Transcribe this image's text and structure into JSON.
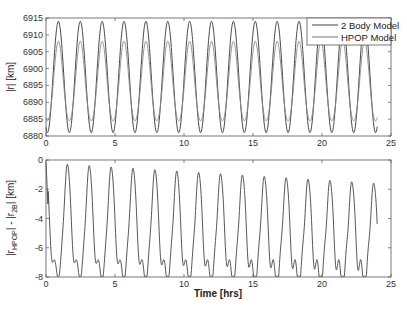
{
  "chart_data": [
    {
      "type": "line",
      "title": "",
      "xlabel": "",
      "ylabel": "|r| [km]",
      "xlim": [
        0,
        25
      ],
      "ylim": [
        6880,
        6915
      ],
      "xticks": [
        0,
        5,
        10,
        15,
        20,
        25
      ],
      "yticks": [
        6880,
        6885,
        6890,
        6895,
        6900,
        6905,
        6910,
        6915
      ],
      "grid": false,
      "legend_position": "upper right",
      "series": [
        {
          "name": "2 Body Model",
          "model": {
            "mean": 6897.5,
            "amp": 16.5,
            "period": 1.585,
            "phase_peak": 0.9,
            "harm2": 0,
            "t_end": 24
          }
        },
        {
          "name": "HPOP Model",
          "model": {
            "mean": 6895.5,
            "amp": 11.8,
            "period": 1.585,
            "phase_peak": 0.9,
            "harm2": 0.8,
            "t_end": 24
          }
        }
      ],
      "summary": {
        "2 Body Model": {
          "max": 6914,
          "min": 6881
        },
        "HPOP Model": {
          "max": 6907,
          "min": 6883.5
        }
      }
    },
    {
      "type": "line",
      "title": "",
      "xlabel": "Time [hrs]",
      "ylabel": "|r_HPOP| - |r_2B| [km]",
      "xlim": [
        0,
        25
      ],
      "ylim": [
        -8,
        0
      ],
      "xticks": [
        0,
        5,
        10,
        15,
        20,
        25
      ],
      "yticks": [
        -8,
        -6,
        -4,
        -2,
        0
      ],
      "grid": false,
      "series": [
        {
          "name": "difference",
          "peaks_start": -0.2,
          "peaks_end": -1.6,
          "troughs_start": -7.5,
          "troughs_end": -8.0,
          "t_end": 24,
          "end_value": -3.8
        }
      ]
    }
  ],
  "legend": {
    "items": [
      "2 Body Model",
      "HPOP Model"
    ]
  },
  "axes": {
    "top": {
      "ylabel": "|r| [km]",
      "yticks": [
        "6880",
        "6885",
        "6890",
        "6895",
        "6900",
        "6905",
        "6910",
        "6915"
      ],
      "xticks": [
        "0",
        "5",
        "10",
        "15",
        "20",
        "25"
      ]
    },
    "bottom": {
      "ylabel_main": "|r",
      "ylabel_sub1": "HPOP",
      "ylabel_mid": "| - |r",
      "ylabel_sub2": "2B",
      "ylabel_end": "| [km]",
      "yticks": [
        "0",
        "-2",
        "-4",
        "-6",
        "-8"
      ],
      "xticks": [
        "0",
        "5",
        "10",
        "15",
        "20",
        "25"
      ],
      "xlabel": "Time [hrs]"
    }
  }
}
